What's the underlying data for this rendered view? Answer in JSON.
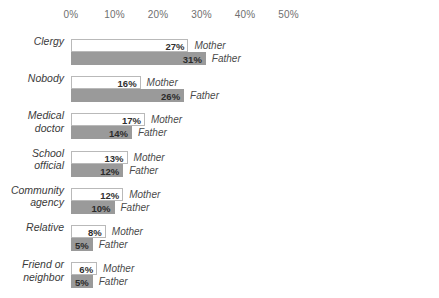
{
  "chart_data": {
    "type": "bar",
    "orientation": "horizontal",
    "title": "",
    "xlabel": "",
    "ylabel": "",
    "xlim": [
      0,
      50
    ],
    "grid": false,
    "legend_position": "inline-right-of-bars",
    "tick_labels": [
      "0%",
      "10%",
      "20%",
      "30%",
      "40%",
      "50%"
    ],
    "tick_values": [
      0,
      10,
      20,
      30,
      40,
      50
    ],
    "categories": [
      "Clergy",
      "Nobody",
      "Medical doctor",
      "School official",
      "Community agency",
      "Relative",
      "Friend or neighbor"
    ],
    "category_lines": [
      [
        "Clergy",
        ""
      ],
      [
        "Nobody",
        ""
      ],
      [
        "Medical",
        "doctor"
      ],
      [
        "School",
        "official"
      ],
      [
        "Community",
        "agency"
      ],
      [
        "Relative",
        ""
      ],
      [
        "Friend or",
        "neighbor"
      ]
    ],
    "series": [
      {
        "name": "Mother",
        "values": [
          27,
          16,
          17,
          13,
          12,
          8,
          6
        ],
        "value_labels": [
          "27%",
          "16%",
          "17%",
          "13%",
          "12%",
          "8%",
          "6%"
        ],
        "color": "#ffffff",
        "border_color": "#b9b9b9"
      },
      {
        "name": "Father",
        "values": [
          31,
          26,
          14,
          12,
          10,
          5,
          5
        ],
        "value_labels": [
          "31%",
          "26%",
          "14%",
          "12%",
          "10%",
          "5%",
          "5%"
        ],
        "color": "#9a9a9a",
        "border_color": "#9a9a9a"
      }
    ]
  }
}
